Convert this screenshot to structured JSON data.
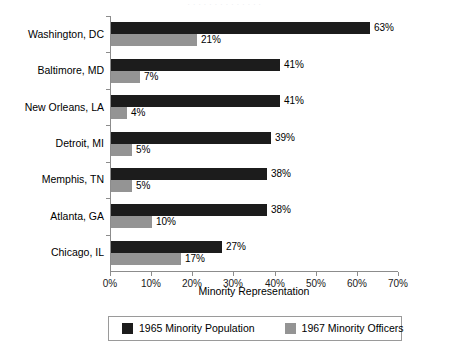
{
  "top_clip_text": "· ·  · ·   ·  ·   ·     ·  ·   ·   ·   ·  ·  ·",
  "legend": {
    "series": [
      {
        "label": "1965 Minority Population",
        "color": "#1c1c1c"
      },
      {
        "label": "1967 Minority Officers",
        "color": "#949494"
      }
    ]
  },
  "axis": {
    "x_title": "Minority Representation",
    "x_ticks": [
      "0%",
      "10%",
      "20%",
      "30%",
      "40%",
      "50%",
      "60%",
      "70%"
    ]
  },
  "chart_data": {
    "type": "bar",
    "orientation": "horizontal",
    "title": "",
    "xlabel": "Minority Representation",
    "ylabel": "",
    "xlim": [
      0,
      70
    ],
    "xticks": [
      0,
      10,
      20,
      30,
      40,
      50,
      60,
      70
    ],
    "xtick_labels": [
      "0%",
      "10%",
      "20%",
      "30%",
      "40%",
      "50%",
      "60%",
      "70%"
    ],
    "grid": false,
    "legend_position": "bottom",
    "categories": [
      "Washington, DC",
      "Baltimore, MD",
      "New Orleans, LA",
      "Detroit, MI",
      "Memphis, TN",
      "Atlanta, GA",
      "Chicago, IL"
    ],
    "series": [
      {
        "name": "1965 Minority Population",
        "color": "#1c1c1c",
        "values": [
          63,
          41,
          41,
          39,
          38,
          38,
          27
        ],
        "value_labels": [
          "63%",
          "41%",
          "41%",
          "39%",
          "38%",
          "38%",
          "27%"
        ]
      },
      {
        "name": "1967 Minority Officers",
        "color": "#949494",
        "values": [
          21,
          7,
          4,
          5,
          5,
          10,
          17
        ],
        "value_labels": [
          "21%",
          "7%",
          "4%",
          "5%",
          "5%",
          "10%",
          "17%"
        ]
      }
    ]
  }
}
